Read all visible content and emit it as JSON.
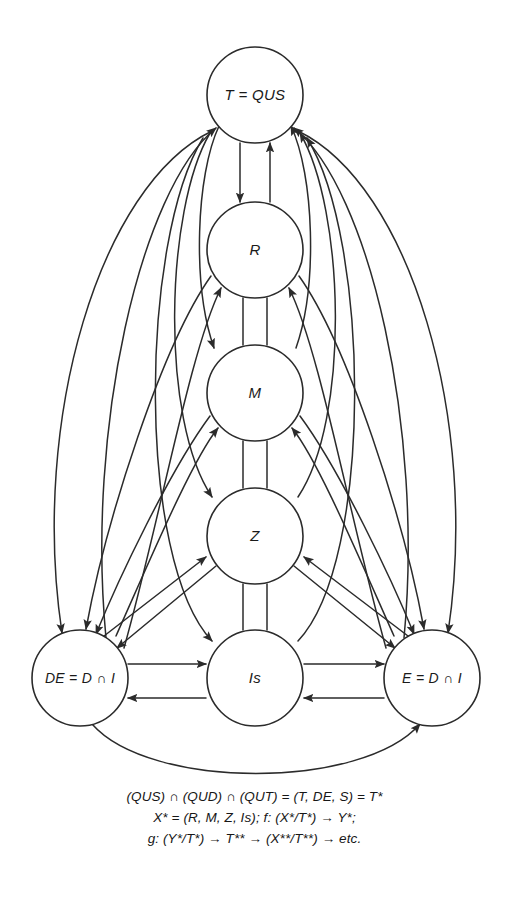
{
  "page": {
    "background": "#ffffff",
    "ink": "#2b2b2b",
    "width": 509,
    "height": 903
  },
  "diagram": {
    "type": "directed-graph",
    "nodes": [
      {
        "id": "T",
        "label": "T = QUS",
        "cx": 255,
        "cy": 95,
        "r": 48
      },
      {
        "id": "R",
        "label": "R",
        "cx": 255,
        "cy": 250,
        "r": 48
      },
      {
        "id": "M",
        "label": "M",
        "cx": 255,
        "cy": 393,
        "r": 48
      },
      {
        "id": "Z",
        "label": "Z",
        "cx": 255,
        "cy": 536,
        "r": 48
      },
      {
        "id": "DE",
        "label": "DE = D ∩ I",
        "cx": 80,
        "cy": 678,
        "r": 48
      },
      {
        "id": "Is",
        "label": "Is",
        "cx": 255,
        "cy": 678,
        "r": 48
      },
      {
        "id": "E",
        "label": "E = D ∩ I",
        "cx": 432,
        "cy": 678,
        "r": 48
      }
    ],
    "edges": [
      {
        "from": "T",
        "to": "R",
        "style": "straight-pair"
      },
      {
        "from": "R",
        "to": "M",
        "style": "straight-pair"
      },
      {
        "from": "M",
        "to": "Z",
        "style": "straight-pair"
      },
      {
        "from": "Z",
        "to": "Is",
        "style": "straight-pair"
      },
      {
        "from": "T",
        "to": "M",
        "style": "curve"
      },
      {
        "from": "T",
        "to": "Z",
        "style": "curve"
      },
      {
        "from": "T",
        "to": "Is",
        "style": "curve"
      },
      {
        "from": "T",
        "to": "DE",
        "style": "long-curve-left"
      },
      {
        "from": "T",
        "to": "E",
        "style": "long-curve-right"
      },
      {
        "from": "R",
        "to": "DE",
        "style": "curve"
      },
      {
        "from": "R",
        "to": "E",
        "style": "curve"
      },
      {
        "from": "M",
        "to": "DE",
        "style": "curve"
      },
      {
        "from": "M",
        "to": "E",
        "style": "curve"
      },
      {
        "from": "Z",
        "to": "DE",
        "style": "diagonal"
      },
      {
        "from": "Z",
        "to": "E",
        "style": "diagonal"
      },
      {
        "from": "DE",
        "to": "Is",
        "style": "horizontal-pair"
      },
      {
        "from": "Is",
        "to": "E",
        "style": "horizontal-pair"
      },
      {
        "from": "DE",
        "to": "E",
        "style": "bottom-arc"
      }
    ]
  },
  "caption": {
    "lines": [
      "(QUS) ∩ (QUD) ∩ (QUT) = (T, DE, S) = T*",
      "X* = (R, M, Z, Is); f: (X*/T*) → Y*;",
      "g: (Y*/T*) → T** → (X**/T**) → etc."
    ]
  }
}
